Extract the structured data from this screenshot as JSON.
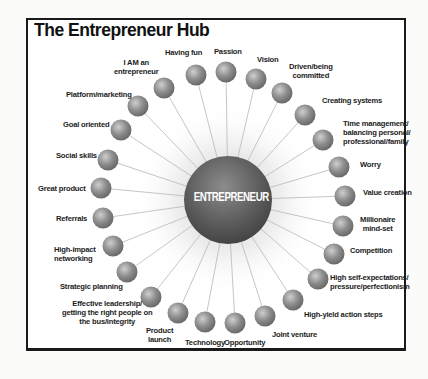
{
  "title": "The Entrepreneur Hub",
  "center": {
    "label": "ENTREPRENEUR",
    "cx": 228,
    "cy": 200,
    "r": 44
  },
  "colors": {
    "node_fill": "#8a8a8a",
    "node_highlight": "#c9c9c9",
    "center_fill": "#5e5e5e",
    "spoke": "#b8b8b8",
    "frame": "#1a1a1a",
    "text": "#1c1c1c"
  },
  "nodes": [
    {
      "label": "Passion",
      "cx": 226,
      "cy": 72,
      "lx": 214,
      "ly": 47,
      "align": "left"
    },
    {
      "label": "Vision",
      "cx": 256,
      "cy": 79,
      "lx": 257,
      "ly": 55,
      "align": "left"
    },
    {
      "label": "Driven/being\ncommitted",
      "cx": 282,
      "cy": 93,
      "lx": 289,
      "ly": 62,
      "align": "center"
    },
    {
      "label": "Creating systems",
      "cx": 305,
      "cy": 115,
      "lx": 322,
      "ly": 96,
      "align": "left"
    },
    {
      "label": "Time management/\nbalancing personal/\nprofessional/family",
      "cx": 323,
      "cy": 140,
      "lx": 343,
      "ly": 119,
      "align": "left"
    },
    {
      "label": "Worry",
      "cx": 339,
      "cy": 167,
      "lx": 360,
      "ly": 160,
      "align": "left"
    },
    {
      "label": "Value creation",
      "cx": 345,
      "cy": 196,
      "lx": 363,
      "ly": 188,
      "align": "left"
    },
    {
      "label": "Millionaire\nmind-set",
      "cx": 343,
      "cy": 226,
      "lx": 360,
      "ly": 215,
      "align": "center"
    },
    {
      "label": "Competition",
      "cx": 334,
      "cy": 254,
      "lx": 350,
      "ly": 246,
      "align": "left"
    },
    {
      "label": "High self-expectations/\npressure/perfectionism",
      "cx": 318,
      "cy": 279,
      "lx": 330,
      "ly": 273,
      "align": "left"
    },
    {
      "label": "High-yield action steps",
      "cx": 293,
      "cy": 300,
      "lx": 304,
      "ly": 310,
      "align": "left"
    },
    {
      "label": "Joint venture",
      "cx": 265,
      "cy": 316,
      "lx": 272,
      "ly": 330,
      "align": "left"
    },
    {
      "label": "Opportunity",
      "cx": 235,
      "cy": 323,
      "lx": 224,
      "ly": 338,
      "align": "left"
    },
    {
      "label": "Technology",
      "cx": 205,
      "cy": 322,
      "lx": 185,
      "ly": 338,
      "align": "left"
    },
    {
      "label": "Product\nlaunch",
      "cx": 178,
      "cy": 313,
      "lx": 146,
      "ly": 326,
      "align": "center"
    },
    {
      "label": "Effective leadership/\ngetting the right people on\nthe bus/integrity",
      "cx": 151,
      "cy": 297,
      "lx": 62,
      "ly": 299,
      "align": "center"
    },
    {
      "label": "Strategic planning",
      "cx": 127,
      "cy": 272,
      "lx": 60,
      "ly": 282,
      "align": "left"
    },
    {
      "label": "High-impact\nnetworking",
      "cx": 113,
      "cy": 246,
      "lx": 54,
      "ly": 245,
      "align": "left"
    },
    {
      "label": "Referrals",
      "cx": 103,
      "cy": 218,
      "lx": 56,
      "ly": 214,
      "align": "left"
    },
    {
      "label": "Great product",
      "cx": 101,
      "cy": 188,
      "lx": 38,
      "ly": 184,
      "align": "left"
    },
    {
      "label": "Social skills",
      "cx": 108,
      "cy": 160,
      "lx": 56,
      "ly": 151,
      "align": "left"
    },
    {
      "label": "Goal oriented",
      "cx": 121,
      "cy": 130,
      "lx": 63,
      "ly": 120,
      "align": "left"
    },
    {
      "label": "Platform/marketing",
      "cx": 138,
      "cy": 106,
      "lx": 66,
      "ly": 90,
      "align": "left"
    },
    {
      "label": "I AM an\nentrepreneur",
      "cx": 164,
      "cy": 88,
      "lx": 114,
      "ly": 58,
      "align": "center"
    },
    {
      "label": "Having fun",
      "cx": 196,
      "cy": 75,
      "lx": 165,
      "ly": 48,
      "align": "left"
    }
  ]
}
